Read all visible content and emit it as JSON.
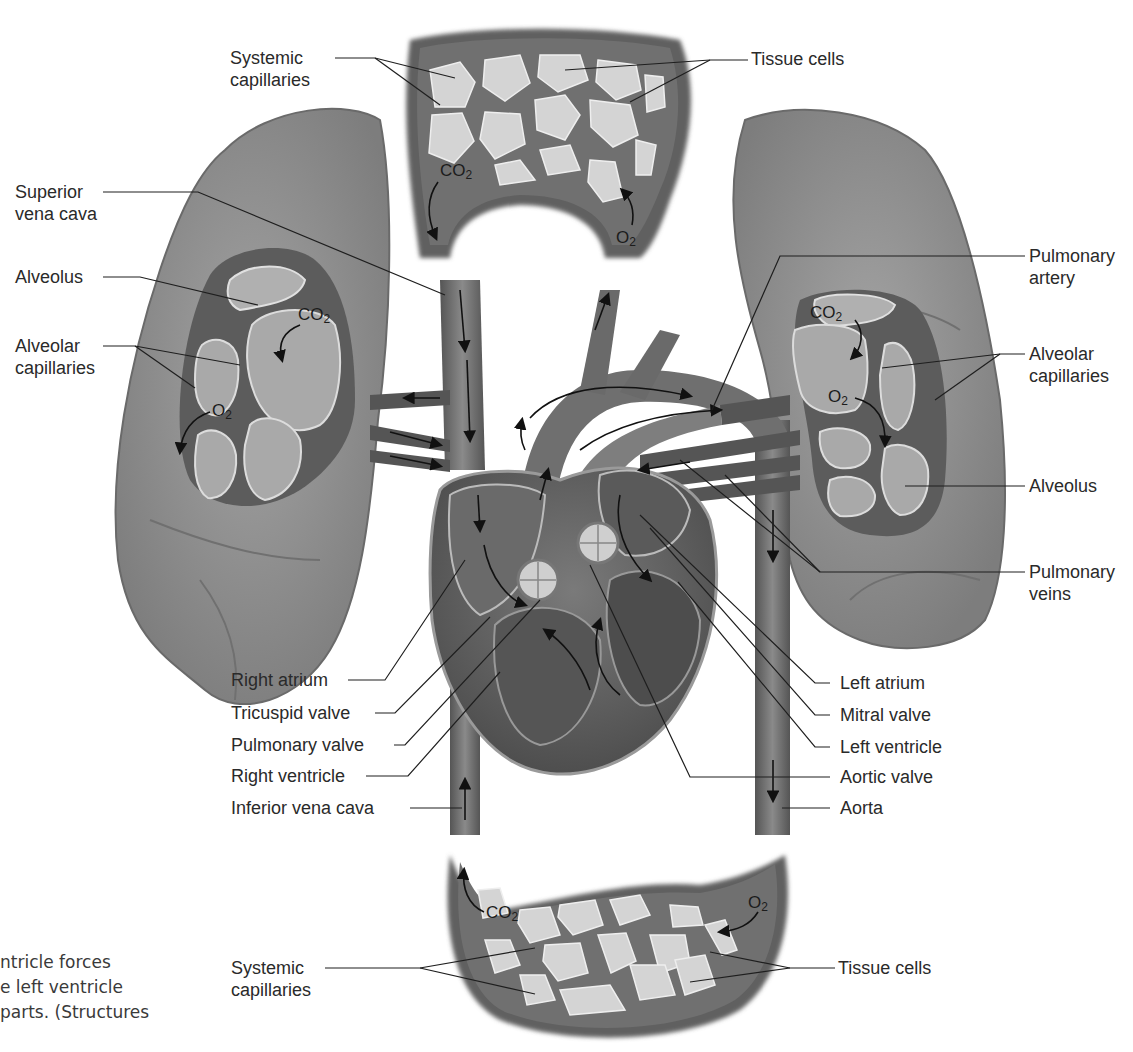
{
  "diagram": {
    "palette": {
      "background": "#ffffff",
      "lung": "#8c8c8c",
      "vessel": "#6b6b6b",
      "vessel_dark": "#4a4a4a",
      "tissue_cell": "#d8d8d8",
      "alveolus": "#a8a8a8",
      "text": "#2a2a2a",
      "leader_line": "#1e1e1e"
    },
    "labels": {
      "systemic_capillaries_top": [
        "Systemic",
        "capillaries"
      ],
      "tissue_cells_top": "Tissue cells",
      "superior_vena_cava": [
        "Superior",
        "vena cava"
      ],
      "alveolus_left": "Alveolus",
      "alveolar_capillaries_left": [
        "Alveolar",
        "capillaries"
      ],
      "pulmonary_artery": [
        "Pulmonary",
        "artery"
      ],
      "alveolar_capillaries_right": [
        "Alveolar",
        "capillaries"
      ],
      "alveolus_right": "Alveolus",
      "pulmonary_veins": [
        "Pulmonary",
        "veins"
      ],
      "right_atrium": "Right atrium",
      "tricuspid_valve": "Tricuspid valve",
      "pulmonary_valve": "Pulmonary valve",
      "right_ventricle": "Right ventricle",
      "inferior_vena_cava": "Inferior vena cava",
      "left_atrium": "Left atrium",
      "mitral_valve": "Mitral valve",
      "left_ventricle": "Left ventricle",
      "aortic_valve": "Aortic valve",
      "aorta": "Aorta",
      "systemic_capillaries_bottom": [
        "Systemic",
        "capillaries"
      ],
      "tissue_cells_bottom": "Tissue cells"
    },
    "gas_labels": {
      "co2": "CO2",
      "o2": "O2"
    },
    "caption_fragment": [
      "ntricle forces",
      "e left ventricle",
      "parts. (Structures"
    ]
  }
}
